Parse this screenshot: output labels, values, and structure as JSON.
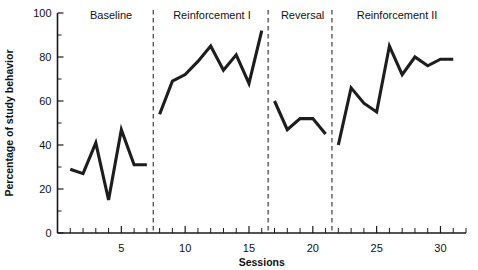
{
  "chart_data": {
    "type": "line",
    "title": "",
    "xlabel": "Sessions",
    "ylabel": "Percentage of study behavior",
    "xlim": [
      0,
      32
    ],
    "ylim": [
      0,
      100
    ],
    "yticks": [
      0,
      20,
      40,
      60,
      80,
      100
    ],
    "ytick_labels": [
      "0",
      "20",
      "40",
      "60",
      "80",
      "100"
    ],
    "y_minor_step": 10,
    "xticks": [
      5,
      10,
      15,
      20,
      25,
      30
    ],
    "xtick_labels": [
      "5",
      "10",
      "15",
      "20",
      "25",
      "30"
    ],
    "x_minor_step": 1,
    "grid": false,
    "legend": "none",
    "line_color": "#1d1d1d",
    "x": [
      1,
      2,
      3,
      4,
      5,
      6,
      7,
      8,
      9,
      10,
      11,
      12,
      13,
      14,
      15,
      16,
      17,
      18,
      19,
      20,
      21,
      22,
      23,
      24,
      25,
      26,
      27,
      28,
      29,
      30,
      31
    ],
    "values": [
      29,
      27,
      41,
      15,
      47,
      31,
      31,
      54,
      69,
      72,
      78,
      85,
      74,
      81,
      68,
      92,
      60,
      47,
      52,
      52,
      45,
      40,
      66,
      59,
      55,
      85,
      72,
      80,
      76,
      79,
      79
    ],
    "series": [
      {
        "name": "Percentage of study behavior",
        "values": [
          29,
          27,
          41,
          15,
          47,
          31,
          31,
          54,
          69,
          72,
          78,
          85,
          74,
          81,
          68,
          92,
          60,
          47,
          52,
          52,
          45,
          40,
          66,
          59,
          55,
          85,
          72,
          80,
          76,
          79,
          79
        ]
      }
    ],
    "phases": [
      {
        "label": "Baseline",
        "x_start": 1,
        "x_end": 7,
        "divider_after": 7.5,
        "label_x": 4.2
      },
      {
        "label": "Reinforcement I",
        "x_start": 8,
        "x_end": 16,
        "divider_after": 16.5,
        "label_x": 12.1
      },
      {
        "label": "Reversal",
        "x_start": 17,
        "x_end": 21,
        "divider_after": 21.5,
        "label_x": 19.2
      },
      {
        "label": "Reinforcement II",
        "x_start": 22,
        "x_end": 31,
        "divider_after": null,
        "label_x": 26.6
      }
    ],
    "annotations": []
  }
}
